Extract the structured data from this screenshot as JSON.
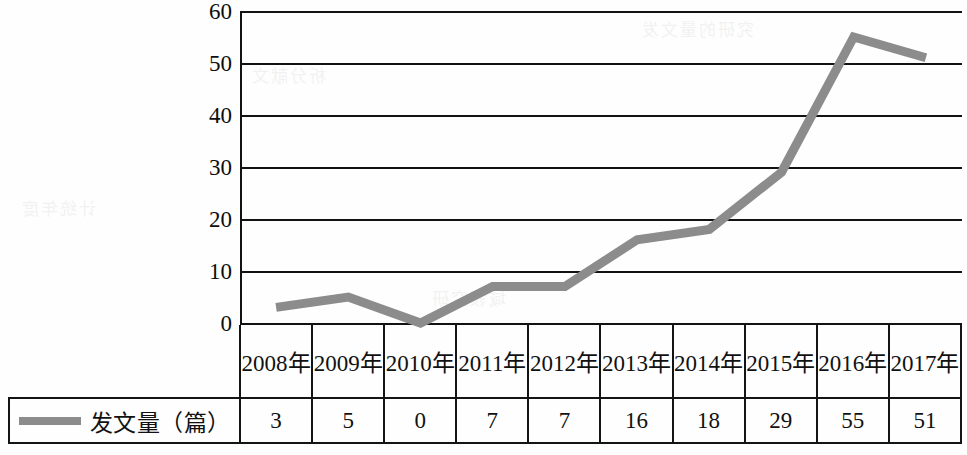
{
  "chart_data": {
    "type": "line",
    "title": "",
    "xlabel": "",
    "ylabel": "",
    "categories": [
      "2008年",
      "2009年",
      "2010年",
      "2011年",
      "2012年",
      "2013年",
      "2014年",
      "2015年",
      "2016年",
      "2017年"
    ],
    "series": [
      {
        "name": "发文量（篇）",
        "values": [
          3,
          5,
          0,
          7,
          7,
          16,
          18,
          29,
          55,
          51
        ],
        "color": "#8c8c8c"
      }
    ],
    "ylim": [
      0,
      60
    ],
    "yticks": [
      0,
      10,
      20,
      30,
      40,
      50,
      60
    ],
    "ytick_labels": [
      "0",
      "10",
      "20",
      "30",
      "40",
      "50",
      "60"
    ],
    "grid": "horizontal",
    "legend_position": "table-row-left",
    "annotations": []
  },
  "table": {
    "legend_label": "发文量（篇）",
    "legend_marker": "line-swatch",
    "header_blank": "",
    "headers": [
      "2008年",
      "2009年",
      "2010年",
      "2011年",
      "2012年",
      "2013年",
      "2014年",
      "2015年",
      "2016年",
      "2017年"
    ],
    "values": [
      "3",
      "5",
      "0",
      "7",
      "7",
      "16",
      "18",
      "29",
      "55",
      "51"
    ]
  },
  "axis": {
    "y_labels": [
      "60",
      "50",
      "40",
      "30",
      "20",
      "10",
      "0"
    ]
  },
  "colors": {
    "line": "#8c8c8c",
    "axis": "#121212",
    "text": "#111111",
    "background": "#ffffff"
  },
  "bleed": {
    "t1": "究研的量文发",
    "t2": "析分献文",
    "t3": "计统年度",
    "t4": "域领究研"
  }
}
